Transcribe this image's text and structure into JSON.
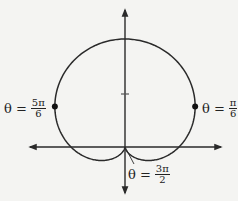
{
  "diagram": {
    "type": "polar-curve",
    "curve": "cardioid r = 1 + sin(theta)",
    "origin": [
      125,
      147
    ],
    "scale_px_per_unit": 54,
    "axes": {
      "x": {
        "from": 30,
        "to": 221,
        "y": 147
      },
      "y": {
        "from": 193,
        "to": 10,
        "x": 125
      }
    },
    "tick": {
      "x": 125,
      "y": 94
    },
    "colors": {
      "stroke": "#2a2a2a",
      "background": "#f4f4f2"
    },
    "points": [
      {
        "name": "point-5pi-6",
        "theta_label": "θ =",
        "num": "5π",
        "den": "6"
      },
      {
        "name": "point-pi-6",
        "theta_label": "θ =",
        "num": "π",
        "den": "6"
      },
      {
        "name": "point-3pi-2",
        "theta_label": "θ =",
        "num": "3π",
        "den": "2"
      }
    ]
  }
}
